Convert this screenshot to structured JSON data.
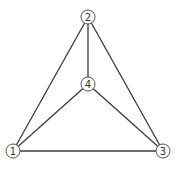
{
  "diagram": {
    "type": "graph",
    "nodes": [
      {
        "id": "1",
        "label": "1",
        "x": 13,
        "y": 151
      },
      {
        "id": "2",
        "label": "2",
        "x": 88,
        "y": 17
      },
      {
        "id": "3",
        "label": "3",
        "x": 163,
        "y": 151
      },
      {
        "id": "4",
        "label": "4",
        "x": 88,
        "y": 84
      }
    ],
    "edges": [
      {
        "from": "1",
        "to": "2"
      },
      {
        "from": "2",
        "to": "3"
      },
      {
        "from": "1",
        "to": "3"
      },
      {
        "from": "2",
        "to": "4"
      },
      {
        "from": "1",
        "to": "4"
      },
      {
        "from": "3",
        "to": "4"
      }
    ],
    "node_radius": 7,
    "colors": {
      "edge": "#3a3a3a",
      "node_stroke": "#555555",
      "label": "#333333",
      "background": "#ffffff"
    }
  }
}
